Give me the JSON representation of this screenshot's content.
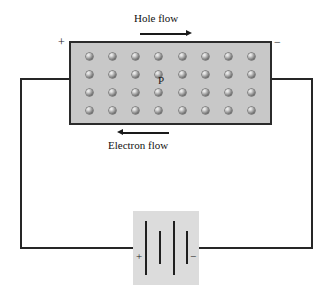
{
  "diagram": {
    "semiconductor": {
      "type_label": "P",
      "fill_color": "#c8c8c8",
      "border_color": "#2b2b2b",
      "hole_columns": 8,
      "hole_rows": 4,
      "hole_count": 32,
      "hole_icon": "hole-sphere-icon"
    },
    "terminals": {
      "left_sign": "+",
      "right_sign": "−"
    },
    "flows": [
      {
        "label": "Hole flow",
        "direction": "right",
        "position": "above-block",
        "arrow_icon": "arrow-right-icon"
      },
      {
        "label": "Electron flow",
        "direction": "left",
        "position": "below-block",
        "arrow_icon": "arrow-left-icon"
      }
    ],
    "battery": {
      "plus_sign": "+",
      "minus_sign": "−",
      "plate_count": 4,
      "plate_pattern": "long-short-long-short",
      "box_color": "#dcdcdc"
    },
    "wire_color": "#262626"
  }
}
